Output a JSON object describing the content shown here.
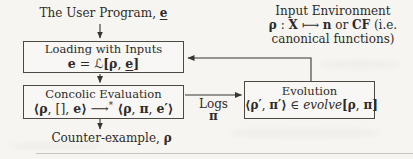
{
  "labels": {
    "user_program": {
      "text": "The User Program, ",
      "var": "e"
    },
    "counter_example": {
      "text": "Counter-example, ",
      "var": "ρ"
    },
    "logs": {
      "line1": "Logs",
      "line2": "π"
    }
  },
  "input_env": {
    "line1": "Input Environment",
    "line2": {
      "rho": "ρ",
      "colon": " : ",
      "X": "X",
      "mapsto": " ⟼ ",
      "n": "n",
      "or": " or ",
      "CF": "CF",
      "rest": " (i.e."
    },
    "line3": "canonical functions)"
  },
  "boxes": {
    "loading": {
      "title": "Loading with Inputs",
      "formula": {
        "e": "e",
        "eq": " = ",
        "L": "ℒ",
        "lb": "[",
        "rho": "ρ",
        "comma": ", ",
        "e2": "e",
        "rb": "]"
      }
    },
    "concolic": {
      "title": "Concolic Evaluation",
      "formula": {
        "o1": "⟨",
        "rho": "ρ",
        "c1": ", ",
        "nil": "[]",
        "c2": ", ",
        "e": "e",
        "cl1": "⟩",
        "arrow": " ⟶",
        "star": "*",
        "o2": " ⟨",
        "rho2": "ρ",
        "c3": ", ",
        "pi": "π",
        "c4": ", ",
        "ep": "e′",
        "cl2": "⟩"
      }
    },
    "evolution": {
      "title": "Evolution",
      "formula": {
        "o": "⟨",
        "rhop": "ρ′",
        "c1": ", ",
        "pip": "π′",
        "cl": "⟩",
        "in": " ∈ ",
        "fn": "evolve",
        "lb": "[",
        "rho": "ρ",
        "c2": ", ",
        "pi": "π",
        "rb": "]"
      }
    }
  },
  "colors": {
    "paper": "#f6f5f2",
    "ink": "#2e2b27",
    "wire": "#39362f",
    "rule": "#ccc8c0"
  }
}
